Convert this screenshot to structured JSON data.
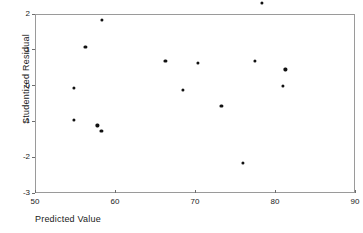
{
  "chart_data": {
    "type": "scatter",
    "title": "",
    "xlabel": "Predicted Value",
    "ylabel": "Studentized Residual",
    "xlim": [
      50,
      90
    ],
    "ylim": [
      -3,
      2
    ],
    "xticks": [
      50,
      60,
      70,
      80,
      90
    ],
    "yticks": [
      2,
      1,
      0,
      -1,
      -2,
      -3
    ],
    "xtick_labels": [
      "50",
      "60",
      "70",
      "80",
      "90"
    ],
    "ytick_labels": [
      "2",
      "1",
      "0",
      "-1",
      "-2",
      "-3"
    ],
    "grid": false,
    "legend": false,
    "marker": "filled-circle",
    "marker_color": "#111111",
    "frame_color": "#9a9a9a",
    "points": [
      {
        "x": 54.9,
        "y": -0.06
      },
      {
        "x": 54.9,
        "y": -0.95
      },
      {
        "x": 56.3,
        "y": 1.08
      },
      {
        "x": 57.8,
        "y": -1.11
      },
      {
        "x": 58.3,
        "y": -1.26
      },
      {
        "x": 58.4,
        "y": 1.84
      },
      {
        "x": 66.3,
        "y": 0.7
      },
      {
        "x": 68.5,
        "y": -0.11
      },
      {
        "x": 70.4,
        "y": 0.64
      },
      {
        "x": 73.3,
        "y": -0.56
      },
      {
        "x": 76.0,
        "y": -2.16
      },
      {
        "x": 77.5,
        "y": 0.7
      },
      {
        "x": 78.4,
        "y": 2.32,
        "clipped_top": true
      },
      {
        "x": 81.0,
        "y": 0.0
      },
      {
        "x": 81.3,
        "y": 0.45
      }
    ]
  }
}
